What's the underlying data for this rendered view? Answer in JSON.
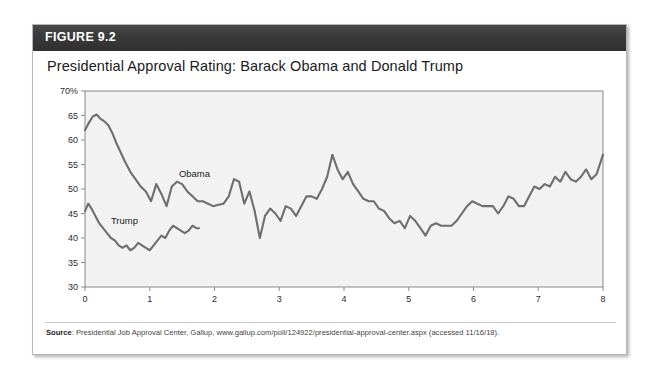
{
  "figure": {
    "number_label": "FIGURE 9.2",
    "title": "Presidential Approval Rating: Barack Obama and Donald Trump",
    "source_prefix": "Source",
    "source_text": ": Presidential Job Approval Center, Gallup, www.gallup.com/poll/124922/presidential-approval-center.aspx (accessed 11/16/18)."
  },
  "colors": {
    "header_bar": "#3a3a3a",
    "line": "#6e6e6e",
    "plot_background": "#f2f2f2",
    "plot_border": "#8a8a8a",
    "card_border": "#b8b8b8"
  },
  "chart_data": {
    "type": "line",
    "title": "Presidential Approval Rating: Barack Obama and Donald Trump",
    "xlabel": "",
    "ylabel": "",
    "xlim": [
      0,
      8
    ],
    "ylim": [
      30,
      70
    ],
    "ytick_labels": [
      "70%",
      "65",
      "60",
      "55",
      "50",
      "45",
      "40",
      "35",
      "30"
    ],
    "ytick_values": [
      70,
      65,
      60,
      55,
      50,
      45,
      40,
      35,
      30
    ],
    "xtick_labels": [
      "0",
      "1",
      "2",
      "3",
      "4",
      "5",
      "6",
      "7",
      "8"
    ],
    "xtick_values": [
      0,
      1,
      2,
      3,
      4,
      5,
      6,
      7,
      8
    ],
    "grid": false,
    "legend": "inline-labels",
    "series": [
      {
        "name": "Obama",
        "label_x": 1.45,
        "label_y": 52.5,
        "x": [
          0.0,
          0.06,
          0.12,
          0.18,
          0.24,
          0.3,
          0.36,
          0.42,
          0.48,
          0.55,
          0.62,
          0.7,
          0.78,
          0.86,
          0.94,
          1.02,
          1.1,
          1.18,
          1.26,
          1.34,
          1.42,
          1.5,
          1.58,
          1.66,
          1.74,
          1.82,
          1.9,
          1.98,
          2.06,
          2.14,
          2.22,
          2.3,
          2.38,
          2.46,
          2.54,
          2.62,
          2.7,
          2.78,
          2.86,
          2.94,
          3.02,
          3.1,
          3.18,
          3.26,
          3.34,
          3.42,
          3.5,
          3.58,
          3.66,
          3.74,
          3.82,
          3.9,
          3.98,
          4.06,
          4.14,
          4.22,
          4.3,
          4.38,
          4.46,
          4.54,
          4.62,
          4.7,
          4.78,
          4.86,
          4.94,
          5.02,
          5.1,
          5.18,
          5.26,
          5.34,
          5.42,
          5.5,
          5.58,
          5.66,
          5.74,
          5.82,
          5.9,
          5.98,
          6.06,
          6.14,
          6.22,
          6.3,
          6.38,
          6.46,
          6.54,
          6.62,
          6.7,
          6.78,
          6.86,
          6.94,
          7.02,
          7.1,
          7.18,
          7.26,
          7.34,
          7.42,
          7.5,
          7.58,
          7.66,
          7.74,
          7.82,
          7.9,
          8.0
        ],
        "y": [
          62.0,
          63.5,
          64.8,
          65.2,
          64.3,
          63.8,
          63.0,
          61.5,
          59.5,
          57.5,
          55.5,
          53.5,
          52.0,
          50.5,
          49.5,
          47.5,
          51.0,
          49.0,
          46.5,
          50.5,
          51.5,
          51.0,
          49.5,
          48.5,
          47.5,
          47.5,
          47.0,
          46.5,
          46.8,
          47.0,
          48.5,
          52.0,
          51.5,
          47.0,
          49.5,
          45.5,
          40.0,
          44.5,
          46.0,
          45.0,
          43.5,
          46.5,
          46.0,
          44.5,
          46.5,
          48.5,
          48.5,
          48.0,
          50.0,
          52.5,
          57.0,
          54.0,
          52.0,
          53.5,
          51.0,
          49.5,
          48.0,
          47.5,
          47.5,
          46.0,
          45.5,
          44.0,
          43.0,
          43.5,
          42.0,
          44.5,
          43.5,
          42.0,
          40.5,
          42.5,
          43.0,
          42.5,
          42.5,
          42.5,
          43.5,
          45.0,
          46.5,
          47.5,
          47.0,
          46.5,
          46.5,
          46.5,
          45.0,
          46.5,
          48.5,
          48.0,
          46.5,
          46.5,
          48.5,
          50.5,
          50.0,
          51.0,
          50.5,
          52.5,
          51.5,
          53.5,
          52.0,
          51.5,
          52.5,
          54.0,
          52.0,
          53.0,
          57.0
        ]
      },
      {
        "name": "Trump",
        "label_x": 0.4,
        "label_y": 42.8,
        "x": [
          0.0,
          0.05,
          0.1,
          0.16,
          0.22,
          0.28,
          0.34,
          0.4,
          0.46,
          0.52,
          0.58,
          0.64,
          0.7,
          0.76,
          0.82,
          0.88,
          0.94,
          1.0,
          1.06,
          1.12,
          1.18,
          1.24,
          1.3,
          1.36,
          1.42,
          1.48,
          1.54,
          1.6,
          1.66,
          1.72,
          1.76
        ],
        "y": [
          45.5,
          47.0,
          46.0,
          44.5,
          43.0,
          42.0,
          41.0,
          40.0,
          39.5,
          38.5,
          38.0,
          38.5,
          37.5,
          38.0,
          39.0,
          38.5,
          38.0,
          37.5,
          38.5,
          39.5,
          40.5,
          40.0,
          41.5,
          42.5,
          42.0,
          41.5,
          41.0,
          41.5,
          42.5,
          42.0,
          42.0
        ]
      }
    ]
  }
}
